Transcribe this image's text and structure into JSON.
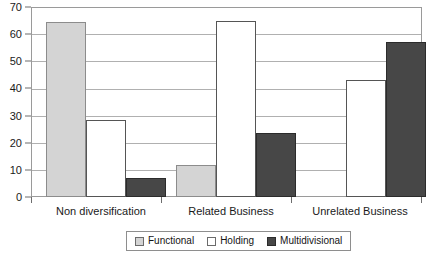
{
  "chart_data": {
    "type": "bar",
    "title": "",
    "subtitle": "",
    "xlabel": "",
    "ylabel": "",
    "ylim": [
      0,
      70
    ],
    "ytick_step": 10,
    "yticks": [
      0,
      10,
      20,
      30,
      40,
      50,
      60,
      70
    ],
    "grid": true,
    "legend_position": "bottom",
    "categories": [
      "Non diversification",
      "Related Business",
      "Unrelated Business"
    ],
    "series": [
      {
        "name": "Functional",
        "color": "#d4d4d4",
        "values": [
          64.5,
          11.8,
          0
        ]
      },
      {
        "name": "Holding",
        "color": "#ffffff",
        "values": [
          28.5,
          65,
          43
        ]
      },
      {
        "name": "Multidivisional",
        "color": "#474747",
        "values": [
          7,
          23.5,
          57
        ]
      }
    ]
  },
  "legend": {
    "items": [
      {
        "label": "Functional"
      },
      {
        "label": "Holding"
      },
      {
        "label": "Multidivisional"
      }
    ]
  }
}
